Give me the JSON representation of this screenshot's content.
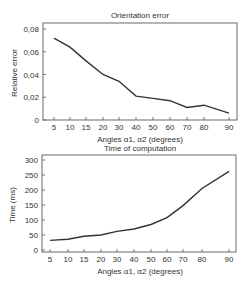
{
  "chart_data": [
    {
      "type": "line",
      "title": "Orientation error",
      "xlabel": "Angles α1, α2 (degrees)",
      "ylabel": "Relative error",
      "categories": [
        "5",
        "10",
        "15",
        "20",
        "30",
        "40",
        "50",
        "60",
        "70",
        "80",
        "90"
      ],
      "values": [
        0.072,
        0.064,
        0.052,
        0.04,
        0.034,
        0.021,
        0.019,
        0.017,
        0.011,
        0.013,
        0.006
      ],
      "yticks": [
        "0",
        "0,02",
        "0,04",
        "0,06",
        "0,08"
      ],
      "ylim": [
        0,
        0.08
      ],
      "grid": false,
      "legend": null
    },
    {
      "type": "line",
      "title": "Time of computation",
      "xlabel": "Angles α1, α2 (degrees)",
      "ylabel": "Time (ms)",
      "categories": [
        "5",
        "10",
        "15",
        "20",
        "30",
        "40",
        "50",
        "60",
        "70",
        "80",
        "90"
      ],
      "values": [
        32,
        36,
        46,
        50,
        62,
        70,
        85,
        108,
        148,
        205,
        262
      ],
      "yticks": [
        "0",
        "50",
        "100",
        "150",
        "200",
        "250",
        "300"
      ],
      "ylim": [
        0,
        300
      ],
      "grid": false,
      "legend": null
    }
  ],
  "charts": {
    "top": {
      "title": "Orientation error",
      "xlabel": "Angles α1, α2 (degrees)",
      "ylabel": "Relative error"
    },
    "bottom": {
      "title": "Time of computation",
      "xlabel": "Angles α1, α2 (degrees)",
      "ylabel": "Time (ms)"
    }
  }
}
